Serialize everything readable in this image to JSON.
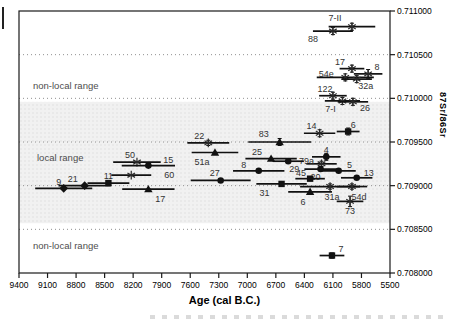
{
  "figure": {
    "y_axis": {
      "title": "87Sr/86Sr",
      "ticks": [
        {
          "v": 0.711,
          "label": "0.711000"
        },
        {
          "v": 0.7105,
          "label": "0.710500"
        },
        {
          "v": 0.71,
          "label": "0.710000"
        },
        {
          "v": 0.7095,
          "label": "0.709500"
        },
        {
          "v": 0.709,
          "label": "0.709000"
        },
        {
          "v": 0.7085,
          "label": "0.708500"
        },
        {
          "v": 0.708,
          "label": "0.708000"
        }
      ]
    },
    "x_axis": {
      "title": "Age (cal B.C.)",
      "ticks": [
        9400,
        9100,
        8800,
        8500,
        8200,
        7900,
        7600,
        7300,
        7000,
        6700,
        6400,
        6100,
        5800,
        5500
      ]
    },
    "annotations": [
      {
        "text": "non-local range",
        "x": 33,
        "y": 89
      },
      {
        "text": "local range",
        "x": 37,
        "y": 161
      },
      {
        "text": "non-local range",
        "x": 33,
        "y": 249
      }
    ],
    "local_band": {
      "from": 0.70857,
      "to": 0.70996,
      "fill": "#f1f1f1",
      "dot": "#e0e0e0"
    },
    "colors": {
      "axis": "#1a1a1a",
      "grid": "#909090",
      "marker": "#111111",
      "label": "#333333",
      "annotation": "#4d4d4d"
    }
  },
  "chart_data": {
    "type": "scatter",
    "title": "",
    "xlabel": "Age (cal B.C.)",
    "ylabel": "87Sr/86Sr",
    "xlim": [
      9400,
      5500
    ],
    "ylim": [
      0.708,
      0.711
    ],
    "x_reversed": true,
    "grid": "dotted-horizontal",
    "legend": "none",
    "points": [
      {
        "label": "7-II",
        "age": 5900,
        "ratio": 0.71082,
        "age_err": 245,
        "ratio_err": 4e-05,
        "marker": "asterisk",
        "ldx": -17,
        "ldy": -6
      },
      {
        "label": "88",
        "age": 6100,
        "ratio": 0.71077,
        "age_err": 210,
        "ratio_err": 4e-05,
        "marker": "asterisk",
        "ldx": -20,
        "ldy": 11
      },
      {
        "label": "17",
        "age": 5900,
        "ratio": 0.71034,
        "age_err": 130,
        "ratio_err": 4e-05,
        "marker": "asterisk",
        "ldx": -12,
        "ldy": -4
      },
      {
        "label": "8",
        "age": 5730,
        "ratio": 0.71028,
        "age_err": 150,
        "ratio_err": 5e-05,
        "marker": "asterisk",
        "ldx": 9,
        "ldy": -4
      },
      {
        "label": "54e",
        "age": 5970,
        "ratio": 0.71024,
        "age_err": 300,
        "ratio_err": 4e-05,
        "marker": "asterisk",
        "ldx": -19,
        "ldy": 0
      },
      {
        "label": "32a",
        "age": 5850,
        "ratio": 0.71022,
        "age_err": 160,
        "ratio_err": 4e-05,
        "marker": "asterisk",
        "ldx": 9,
        "ldy": 10
      },
      {
        "label": "122",
        "age": 6100,
        "ratio": 0.71003,
        "age_err": 145,
        "ratio_err": 4e-05,
        "marker": "asterisk",
        "ldx": -8,
        "ldy": -4
      },
      {
        "label": "7-I",
        "age": 6000,
        "ratio": 0.70997,
        "age_err": 185,
        "ratio_err": 4e-05,
        "marker": "asterisk",
        "ldx": -12,
        "ldy": 11
      },
      {
        "label": "26",
        "age": 5890,
        "ratio": 0.70996,
        "age_err": 160,
        "ratio_err": 4e-05,
        "marker": "asterisk",
        "ldx": 12,
        "ldy": 9
      },
      {
        "label": "14",
        "age": 6240,
        "ratio": 0.7096,
        "age_err": 165,
        "ratio_err": 4e-05,
        "marker": "asterisk",
        "ldx": -8,
        "ldy": -4
      },
      {
        "label": "6",
        "age": 5940,
        "ratio": 0.70962,
        "age_err": 120,
        "ratio_err": 4e-05,
        "marker": "square",
        "ldx": 5,
        "ldy": -4
      },
      {
        "label": "22",
        "age": 7410,
        "ratio": 0.70949,
        "age_err": 220,
        "ratio_err": 3e-05,
        "marker": "asterisk",
        "ldx": -9,
        "ldy": -4
      },
      {
        "label": "83",
        "age": 6660,
        "ratio": 0.7095,
        "age_err": 330,
        "ratio_err": 4e-05,
        "marker": "triangle",
        "ldx": -16,
        "ldy": -5
      },
      {
        "label": "51a",
        "age": 7340,
        "ratio": 0.70938,
        "age_err": 245,
        "ratio_err": 0,
        "marker": "triangle",
        "ldx": -13,
        "ldy": 13
      },
      {
        "label": "25",
        "age": 6750,
        "ratio": 0.70931,
        "age_err": 270,
        "ratio_err": 0,
        "marker": "triangle",
        "ldx": -14,
        "ldy": -4
      },
      {
        "label": "4",
        "age": 6170,
        "ratio": 0.70933,
        "age_err": 150,
        "ratio_err": 4e-05,
        "marker": "circle",
        "ldx": 0,
        "ldy": -4
      },
      {
        "label": "79a",
        "age": 6220,
        "ratio": 0.70925,
        "age_err": 160,
        "ratio_err": 3e-05,
        "marker": "asterisk",
        "ldx": -15,
        "ldy": 0
      },
      {
        "label": "29",
        "age": 6570,
        "ratio": 0.70928,
        "age_err": 165,
        "ratio_err": 0,
        "marker": "circle",
        "ldx": 6,
        "ldy": 11
      },
      {
        "label": "50",
        "age": 8160,
        "ratio": 0.70927,
        "age_err": 250,
        "ratio_err": 0,
        "marker": "asterisk",
        "ldx": -7,
        "ldy": -4
      },
      {
        "label": "15",
        "age": 8040,
        "ratio": 0.70923,
        "age_err": 280,
        "ratio_err": 0,
        "marker": "circle",
        "ldx": 20,
        "ldy": -3
      },
      {
        "label": "60",
        "age": 8220,
        "ratio": 0.70912,
        "age_err": 210,
        "ratio_err": 0,
        "marker": "asterisk",
        "ldx": 38,
        "ldy": 3
      },
      {
        "label": "8",
        "age": 6880,
        "ratio": 0.70917,
        "age_err": 270,
        "ratio_err": 0,
        "marker": "circle",
        "ldx": -15,
        "ldy": -3
      },
      {
        "label": "5",
        "age": 6040,
        "ratio": 0.70917,
        "age_err": 180,
        "ratio_err": 0,
        "marker": "circle",
        "ldx": 11,
        "ldy": -3
      },
      {
        "label": "20",
        "age": 6230,
        "ratio": 0.70919,
        "age_err": 170,
        "ratio_err": 0,
        "marker": "circle",
        "ldx": -5,
        "ldy": 11
      },
      {
        "label": "27",
        "age": 7280,
        "ratio": 0.70906,
        "age_err": 315,
        "ratio_err": 0,
        "marker": "circle",
        "ldx": -6,
        "ldy": -4
      },
      {
        "label": "45",
        "age": 6340,
        "ratio": 0.70908,
        "age_err": 155,
        "ratio_err": 0,
        "marker": "square",
        "ldx": -9,
        "ldy": -3
      },
      {
        "label": "13",
        "age": 5850,
        "ratio": 0.70909,
        "age_err": 165,
        "ratio_err": 0,
        "marker": "circle",
        "ldx": 12,
        "ldy": -2
      },
      {
        "label": "9",
        "age": 8930,
        "ratio": 0.70897,
        "age_err": 300,
        "ratio_err": 0,
        "marker": "diamond",
        "ldx": -5,
        "ldy": -3
      },
      {
        "label": "21",
        "age": 8710,
        "ratio": 0.709,
        "age_err": 275,
        "ratio_err": 0,
        "marker": "diamond",
        "ldx": -12,
        "ldy": -4
      },
      {
        "label": "11",
        "age": 8460,
        "ratio": 0.70903,
        "age_err": 220,
        "ratio_err": 0,
        "marker": "square",
        "ldx": 0,
        "ldy": -4
      },
      {
        "label": "31",
        "age": 6640,
        "ratio": 0.70902,
        "age_err": 265,
        "ratio_err": 0,
        "marker": "square",
        "ldx": -17,
        "ldy": 12
      },
      {
        "label": "31a",
        "age": 6130,
        "ratio": 0.70899,
        "age_err": 315,
        "ratio_err": 3e-05,
        "marker": "asterisk",
        "ldx": 2,
        "ldy": 13
      },
      {
        "label": "54d",
        "age": 5900,
        "ratio": 0.70899,
        "age_err": 160,
        "ratio_err": 3e-05,
        "marker": "asterisk",
        "ldx": 7,
        "ldy": 13
      },
      {
        "label": "17",
        "age": 8040,
        "ratio": 0.70896,
        "age_err": 275,
        "ratio_err": 0,
        "marker": "triangle",
        "ldx": 12,
        "ldy": 13
      },
      {
        "label": "6",
        "age": 6340,
        "ratio": 0.70893,
        "age_err": 230,
        "ratio_err": 0,
        "marker": "triangle",
        "ldx": -7,
        "ldy": 13
      },
      {
        "label": "73",
        "age": 5920,
        "ratio": 0.70882,
        "age_err": 140,
        "ratio_err": 6e-05,
        "marker": "asterisk",
        "ldx": 0,
        "ldy": 13
      },
      {
        "label": "7",
        "age": 6110,
        "ratio": 0.7082,
        "age_err": 130,
        "ratio_err": 3e-05,
        "marker": "square",
        "ldx": 9,
        "ldy": -4
      }
    ]
  }
}
